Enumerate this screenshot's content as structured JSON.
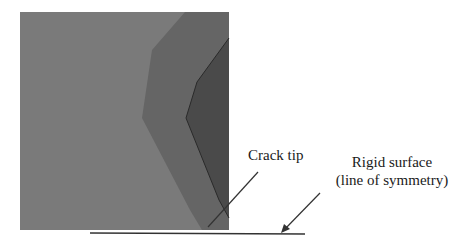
{
  "figure": {
    "labels": {
      "crack_tip": "Crack tip",
      "rigid_surface_line1": "Rigid surface",
      "rigid_surface_line2": "(line of symmetry)"
    },
    "contour_regions": [
      {
        "name": "low",
        "color": "#7a7a7a"
      },
      {
        "name": "medium",
        "color": "#656565"
      },
      {
        "name": "high",
        "color": "#4a4a4a"
      }
    ],
    "line_color": "#333333"
  }
}
